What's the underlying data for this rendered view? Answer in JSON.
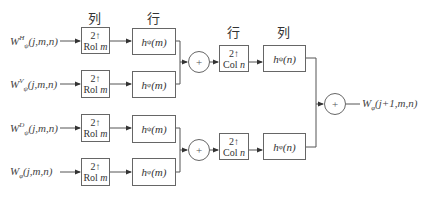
{
  "diagram": {
    "type": "2D inverse wavelet transform synthesis filter bank",
    "headers": [
      "列",
      "行",
      "行",
      "列"
    ],
    "inputs": [
      {
        "base": "W",
        "sup": "H",
        "sub": "ψ",
        "args": "(j,m,n)"
      },
      {
        "base": "W",
        "sup": "V",
        "sub": "ψ",
        "args": "(j,m,n)"
      },
      {
        "base": "W",
        "sup": "D",
        "sub": "ψ",
        "args": "(j,m,n)"
      },
      {
        "base": "W",
        "sup": "",
        "sub": "φ",
        "args": "(j,m,n)"
      }
    ],
    "upsamplers_rows": [
      {
        "factor": "2",
        "arrow": "↑",
        "op": "Rol",
        "var": "m"
      },
      {
        "factor": "2",
        "arrow": "↑",
        "op": "Rol",
        "var": "m"
      },
      {
        "factor": "2",
        "arrow": "↑",
        "op": "Rol",
        "var": "m"
      },
      {
        "factor": "2",
        "arrow": "↑",
        "op": "Rol",
        "var": "m"
      }
    ],
    "row_filters": [
      {
        "name": "h",
        "sub": "ψ",
        "arg": "(m)"
      },
      {
        "name": "h",
        "sub": "φ",
        "arg": "(m)"
      },
      {
        "name": "h",
        "sub": "ψ",
        "arg": "(m)"
      },
      {
        "name": "h",
        "sub": "φ",
        "arg": "(m)"
      }
    ],
    "adders": [
      "+",
      "+",
      "+"
    ],
    "upsamplers_cols": [
      {
        "factor": "2",
        "arrow": "↑",
        "op": "Col",
        "var": "n"
      },
      {
        "factor": "2",
        "arrow": "↑",
        "op": "Col",
        "var": "n"
      }
    ],
    "col_filters": [
      {
        "name": "h",
        "sub": "ψ",
        "arg": "(n)"
      },
      {
        "name": "h",
        "sub": "φ",
        "arg": "(n)"
      }
    ],
    "output": {
      "base": "W",
      "sub": "φ",
      "args": "(j+1,m,n)"
    }
  }
}
